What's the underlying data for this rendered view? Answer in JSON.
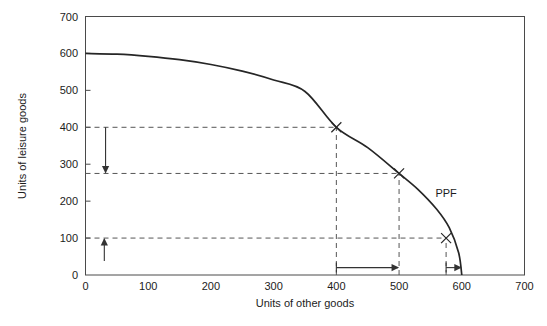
{
  "chart_data": {
    "type": "line",
    "title": "",
    "subtitle": "",
    "xlabel": "Units of other goods",
    "ylabel": "Units of leisure goods",
    "xlim": [
      0,
      700
    ],
    "ylim": [
      0,
      700
    ],
    "xticks": [
      "0",
      "100",
      "200",
      "300",
      "400",
      "500",
      "600",
      "700"
    ],
    "xtick_values": [
      0,
      100,
      200,
      300,
      400,
      500,
      600,
      700
    ],
    "yticks": [
      "0",
      "100",
      "200",
      "300",
      "400",
      "500",
      "600",
      "700"
    ],
    "ytick_values": [
      0,
      100,
      200,
      300,
      400,
      500,
      600,
      700
    ],
    "grid": false,
    "legend_position": "inline-annotation",
    "series": [
      {
        "name": "PPF",
        "label": "PPF",
        "color": "#262626",
        "x": [
          0,
          50,
          100,
          150,
          200,
          250,
          300,
          350,
          400,
          450,
          500,
          530,
          560,
          580,
          595,
          600
        ],
        "y": [
          600,
          598,
          592,
          583,
          570,
          552,
          528,
          497,
          400,
          345,
          275,
          232,
          178,
          128,
          60,
          0
        ]
      }
    ],
    "marked_points": [
      {
        "x": 400,
        "y": 400,
        "marker": "x"
      },
      {
        "x": 500,
        "y": 275,
        "marker": "x"
      },
      {
        "x": 575,
        "y": 100,
        "marker": "x"
      }
    ],
    "guide_lines": [
      {
        "orientation": "horizontal",
        "value": 400,
        "from": 0,
        "to": 400
      },
      {
        "orientation": "horizontal",
        "value": 275,
        "from": 0,
        "to": 500
      },
      {
        "orientation": "horizontal",
        "value": 100,
        "from": 0,
        "to": 575
      },
      {
        "orientation": "vertical",
        "value": 400,
        "from": 0,
        "to": 400
      },
      {
        "orientation": "vertical",
        "value": 500,
        "from": 0,
        "to": 275
      },
      {
        "orientation": "vertical",
        "value": 575,
        "from": 0,
        "to": 100
      }
    ],
    "annotations": [
      {
        "label": "PPF",
        "x": 575,
        "y": 210,
        "kind": "curve-label"
      },
      {
        "kind": "arrow",
        "direction": "down",
        "x": 32,
        "y_from": 400,
        "y_to": 275
      },
      {
        "kind": "arrow",
        "direction": "up",
        "x": 30,
        "y_from": 38,
        "y_to": 100
      },
      {
        "kind": "arrow",
        "direction": "right",
        "y": 20,
        "x_from": 400,
        "x_to": 500
      },
      {
        "kind": "arrow",
        "direction": "right",
        "y": 20,
        "x_from": 575,
        "x_to": 600
      }
    ]
  }
}
